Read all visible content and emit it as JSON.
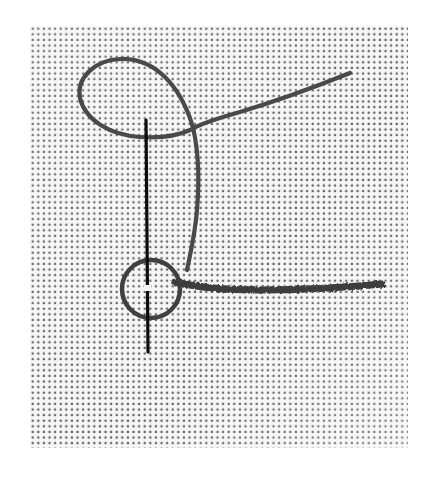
{
  "image": {
    "subject": "Embroidery stitch demonstration: needle and thread forming a knot on even-weave fabric",
    "background_color": "#ffffff",
    "fabric": {
      "x": 30,
      "y": 26,
      "width": 378,
      "height": 422,
      "dot_color": "#1e1e1e",
      "weave_color": "#f4f4f4",
      "pitch": 5.6
    },
    "thread_color": "#4a4a4a",
    "stitched_line_color": "#3c3c3c",
    "needle_color": "#0c0c0c"
  }
}
